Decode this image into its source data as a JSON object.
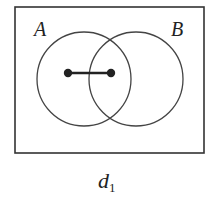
{
  "diagram": {
    "type": "venn",
    "sets": [
      {
        "label": "A",
        "center": [
          84,
          79
        ],
        "radius": 47
      },
      {
        "label": "B",
        "center": [
          136,
          79
        ],
        "radius": 47
      }
    ],
    "points": [
      [
        68,
        73
      ],
      [
        111,
        73
      ]
    ],
    "edge": {
      "from": 0,
      "to": 1
    },
    "frame": {
      "x": 15,
      "y": 7,
      "width": 189,
      "height": 146
    },
    "caption": {
      "main": "d",
      "sub": "1"
    },
    "stroke_color": "#333333"
  }
}
